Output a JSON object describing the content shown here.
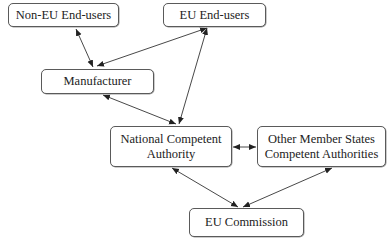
{
  "diagram": {
    "type": "flow",
    "nodes": {
      "non_eu_end_users": {
        "label": "Non-EU End-users"
      },
      "eu_end_users": {
        "label": "EU End-users"
      },
      "manufacturer": {
        "label": "Manufacturer"
      },
      "national_competent_authority": {
        "label_line1": "National Competent",
        "label_line2": "Authority"
      },
      "other_member_states": {
        "label_line1": "Other Member States",
        "label_line2": "Competent Authorities"
      },
      "eu_commission": {
        "label": "EU Commission"
      }
    },
    "edges": [
      {
        "from": "Non-EU End-users",
        "to": "Manufacturer",
        "direction": "bidirectional"
      },
      {
        "from": "EU End-users",
        "to": "Manufacturer",
        "direction": "bidirectional"
      },
      {
        "from": "EU End-users",
        "to": "National Competent Authority",
        "direction": "bidirectional"
      },
      {
        "from": "Manufacturer",
        "to": "National Competent Authority",
        "direction": "bidirectional"
      },
      {
        "from": "National Competent Authority",
        "to": "Other Member States Competent Authorities",
        "direction": "bidirectional"
      },
      {
        "from": "National Competent Authority",
        "to": "EU Commission",
        "direction": "bidirectional"
      },
      {
        "from": "Other Member States Competent Authorities",
        "to": "EU Commission",
        "direction": "bidirectional"
      }
    ],
    "colors": {
      "border": "#5a5a5a",
      "arrow": "#333333",
      "background": "#ffffff"
    }
  }
}
